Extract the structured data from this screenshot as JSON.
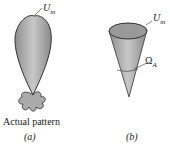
{
  "panel_a": {
    "label_um": "U",
    "label_um_sub": "m",
    "caption": "Actual pattern",
    "sublabel": "(a)"
  },
  "panel_b": {
    "label_um": "U",
    "label_um_sub": "m",
    "label_omega": "Ω",
    "label_omega_sub": "A",
    "sublabel": "(b)"
  },
  "colors": {
    "fill": "#a8a8a8",
    "stroke": "#333333"
  }
}
